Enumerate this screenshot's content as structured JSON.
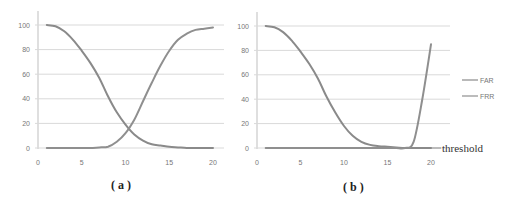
{
  "chart_data": [
    {
      "type": "line",
      "panel_label": "(a)",
      "title": "",
      "xlabel": "",
      "ylabel": "",
      "xlim": [
        0,
        20
      ],
      "ylim": [
        0,
        100
      ],
      "x_ticks": [
        "0",
        "5",
        "10",
        "15",
        "20"
      ],
      "y_ticks": [
        "0",
        "20",
        "40",
        "60",
        "80",
        "100"
      ],
      "grid": "horizontal",
      "x": [
        1,
        2,
        3,
        4,
        5,
        6,
        7,
        8,
        9,
        10,
        11,
        12,
        13,
        14,
        15,
        16,
        17,
        18,
        19,
        20
      ],
      "series": [
        {
          "name": "FAR",
          "values": [
            100,
            99,
            95,
            88,
            79,
            69,
            57,
            42,
            29,
            19,
            11,
            6,
            3,
            2,
            1,
            0.5,
            0,
            0,
            0,
            0
          ]
        },
        {
          "name": "FRR",
          "values": [
            0,
            0,
            0,
            0,
            0,
            0,
            0.5,
            1,
            5,
            12,
            23,
            38,
            53,
            67,
            79,
            88,
            93,
            96,
            97,
            98
          ]
        }
      ]
    },
    {
      "type": "line",
      "panel_label": "(b)",
      "title": "",
      "xlabel": "threshold",
      "ylabel": "",
      "xlim": [
        0,
        20
      ],
      "ylim": [
        0,
        100
      ],
      "x_ticks": [
        "0",
        "5",
        "10",
        "15",
        "20"
      ],
      "y_ticks": [
        "0",
        "20",
        "40",
        "60",
        "80",
        "100"
      ],
      "grid": "horizontal",
      "legend_position": "right",
      "x": [
        1,
        2,
        3,
        4,
        5,
        6,
        7,
        8,
        9,
        10,
        11,
        12,
        13,
        14,
        15,
        16,
        17,
        18,
        19,
        20
      ],
      "series": [
        {
          "name": "FAR",
          "values": [
            100,
            99,
            95,
            88,
            79,
            69,
            57,
            42,
            29,
            18,
            10,
            5,
            2.5,
            1.5,
            1,
            0.5,
            0,
            0,
            0,
            0
          ]
        },
        {
          "name": "FRR",
          "values": [
            0,
            0,
            0,
            0,
            0,
            0,
            0,
            0,
            0,
            0,
            0,
            0,
            0,
            0,
            0,
            0,
            0,
            5,
            40,
            85
          ]
        }
      ]
    }
  ],
  "labels": {
    "panel_a": "( a )",
    "panel_b": "( b )",
    "threshold": "threshold",
    "legend": [
      "FAR",
      "FRR"
    ]
  },
  "colors": {
    "far_line": "#8a8a8a",
    "frr_line": "#8f8f8f",
    "grid": "#d9d9d9",
    "axis": "#bfbfbf"
  }
}
